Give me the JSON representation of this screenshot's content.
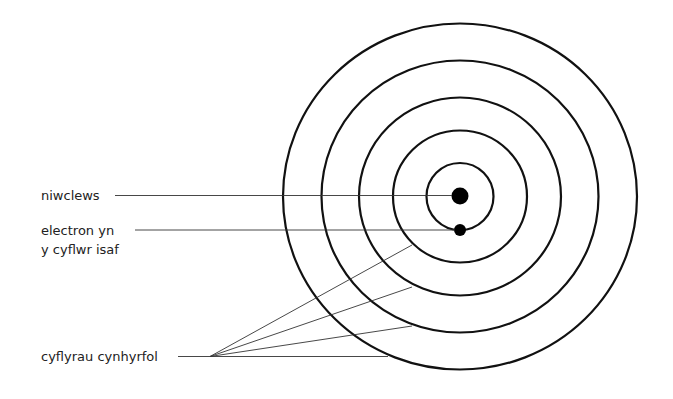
{
  "diagram": {
    "type": "atom-energy-levels",
    "labels": {
      "nucleus": "niwclews",
      "ground_state_line1": "electron yn",
      "ground_state_line2": "y cyflwr isaf",
      "excited_states": "cyflyrau cynhyrfol"
    },
    "colors": {
      "background": "#ffffff",
      "shell": "#111111",
      "leader": "#333333",
      "text": "#222222"
    },
    "shells_count": 5
  }
}
